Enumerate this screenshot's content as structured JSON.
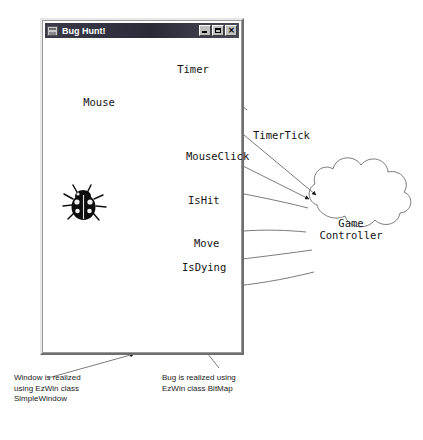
{
  "window": {
    "title": "Bug Hunt!",
    "icon": "window-app-icon",
    "controls": [
      {
        "name": "minimize",
        "glyph": ""
      },
      {
        "name": "maximize",
        "glyph": ""
      },
      {
        "name": "close",
        "glyph": "✕"
      }
    ]
  },
  "clouds": [
    {
      "id": "timer",
      "label": "Timer"
    },
    {
      "id": "mouse",
      "label": "Mouse"
    },
    {
      "id": "game-controller",
      "label": "Game\nController"
    }
  ],
  "objects": [
    {
      "id": "bug",
      "label": "bug-bitmap"
    }
  ],
  "edges": [
    {
      "id": "timer-tick",
      "label": "TimerTick",
      "from": "timer",
      "to": "game-controller"
    },
    {
      "id": "mouse-click",
      "label": "MouseClick",
      "from": "mouse",
      "to": "game-controller"
    },
    {
      "id": "is-hit",
      "label": "IsHit",
      "from": "game-controller",
      "to": "bug"
    },
    {
      "id": "move",
      "label": "Move",
      "from": "game-controller",
      "to": "bug"
    },
    {
      "id": "is-dying",
      "label": "IsDying",
      "from": "game-controller",
      "to": "bug"
    }
  ],
  "annotations": [
    {
      "id": "window-annotation",
      "text": "Window is realized\nusing EzWin class\nSimpleWindow"
    },
    {
      "id": "bug-annotation",
      "text": "Bug is realized using\nEzWin class BitMap"
    }
  ],
  "colors": {
    "titlebar_start": "#3a3a4a",
    "titlebar_end": "#4a4a58",
    "title_text": "#ffffff",
    "window_face": "#c0c0c0",
    "canvas": "#ffffff",
    "line": "#6b6b6b",
    "ink": "#151515"
  }
}
